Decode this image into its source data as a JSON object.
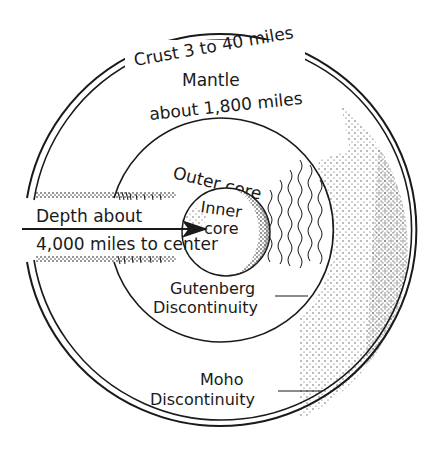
{
  "diagram": {
    "type": "earth-interior-cross-section",
    "ink_color": "#1a1a1a",
    "background": "#ffffff",
    "layers": [
      {
        "id": "crust",
        "label": "Crust 3 to 40 miles"
      },
      {
        "id": "mantle",
        "label_line1": "Mantle",
        "label_line2": "about 1,800 miles"
      },
      {
        "id": "outer-core",
        "label": "Outer core"
      },
      {
        "id": "inner-core",
        "label_line1": "Inner",
        "label_line2": "core"
      }
    ],
    "arrow": {
      "label_line1": "Depth about",
      "label_line2": "4,000 miles to center"
    },
    "callouts": {
      "gutenberg": {
        "line1": "Gutenberg",
        "line2": "Discontinuity"
      },
      "moho": {
        "line1": "Moho",
        "line2": "Discontinuity"
      }
    }
  }
}
